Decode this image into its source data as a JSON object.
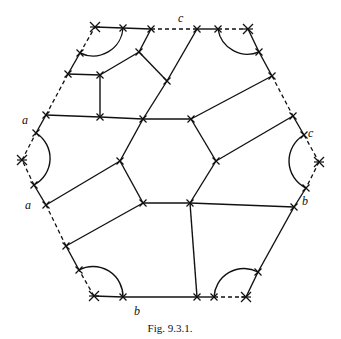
{
  "figure": {
    "caption": "Fig. 9.3.1.",
    "labels": [
      {
        "id": "c-top",
        "text": "c",
        "x": 178,
        "y": 22
      },
      {
        "id": "a-upper",
        "text": "a",
        "x": 22,
        "y": 124
      },
      {
        "id": "a-lower",
        "text": "a",
        "x": 25,
        "y": 209
      },
      {
        "id": "c-right",
        "text": "c",
        "x": 308,
        "y": 137
      },
      {
        "id": "b-right",
        "text": "b",
        "x": 302,
        "y": 205
      },
      {
        "id": "b-bottom",
        "text": "b",
        "x": 134,
        "y": 315
      }
    ],
    "vertices": {
      "TL": [
        95,
        27
      ],
      "T1": [
        123,
        28
      ],
      "T2": [
        151,
        29
      ],
      "T3": [
        197,
        29
      ],
      "T4": [
        218,
        29
      ],
      "TR": [
        248,
        29
      ],
      "UR1": [
        259,
        52
      ],
      "UR2": [
        272,
        76
      ],
      "UR3": [
        293,
        116
      ],
      "UR4": [
        304,
        135
      ],
      "R": [
        319,
        162
      ],
      "LR1": [
        306,
        188
      ],
      "LR2": [
        294,
        207
      ],
      "LR3": [
        258,
        272
      ],
      "BR": [
        246,
        297
      ],
      "B1": [
        214,
        297
      ],
      "B2": [
        197,
        297
      ],
      "B3": [
        123,
        297
      ],
      "BL": [
        94,
        296
      ],
      "LL1": [
        79,
        270
      ],
      "LL2": [
        66,
        246
      ],
      "LL3": [
        46,
        205
      ],
      "LL4": [
        34,
        185
      ],
      "L": [
        22,
        160
      ],
      "UL1": [
        36,
        133
      ],
      "UL2": [
        46,
        115
      ],
      "UL3": [
        68,
        74
      ],
      "UL4": [
        80,
        53
      ],
      "I1": [
        100,
        75
      ],
      "I2": [
        139,
        52
      ],
      "I3": [
        167,
        81
      ],
      "I4": [
        100,
        117
      ],
      "H1": [
        143,
        119
      ],
      "H2": [
        191,
        119
      ],
      "H3": [
        216,
        161
      ],
      "H4": [
        190,
        203
      ],
      "H5": [
        143,
        203
      ],
      "H6": [
        120,
        161
      ]
    },
    "solid_edges": [
      [
        "TL",
        "T1"
      ],
      [
        "T1",
        "T2"
      ],
      [
        "T3",
        "T4"
      ],
      [
        "TR",
        "UR1"
      ],
      [
        "UR1",
        "UR2"
      ],
      [
        "UR3",
        "UR4"
      ],
      [
        "LR1",
        "LR2"
      ],
      [
        "LR2",
        "LR3"
      ],
      [
        "LR3",
        "BR"
      ],
      [
        "B1",
        "B2"
      ],
      [
        "B2",
        "B3"
      ],
      [
        "B3",
        "BL"
      ],
      [
        "LL1",
        "LL2"
      ],
      [
        "LL3",
        "LL4"
      ],
      [
        "UL1",
        "UL2"
      ],
      [
        "UL3",
        "UL4"
      ],
      [
        "UL3",
        "I1"
      ],
      [
        "I1",
        "I2"
      ],
      [
        "I2",
        "T2"
      ],
      [
        "I2",
        "I3"
      ],
      [
        "I3",
        "T3"
      ],
      [
        "I3",
        "H1"
      ],
      [
        "I1",
        "I4"
      ],
      [
        "UL2",
        "I4"
      ],
      [
        "I4",
        "H1"
      ],
      [
        "H1",
        "H2"
      ],
      [
        "H2",
        "H3"
      ],
      [
        "H3",
        "H4"
      ],
      [
        "H4",
        "H5"
      ],
      [
        "H5",
        "H6"
      ],
      [
        "H6",
        "H1"
      ],
      [
        "H2",
        "UR2"
      ],
      [
        "H3",
        "UR3"
      ],
      [
        "H4",
        "LR2"
      ],
      [
        "H4",
        "B2"
      ],
      [
        "H6",
        "LL3"
      ],
      [
        "H5",
        "LL2"
      ]
    ],
    "dashed_edges": [
      [
        "T2",
        "T3"
      ],
      [
        "T4",
        "TR"
      ],
      [
        "UR2",
        "UR3"
      ],
      [
        "UR4",
        "R"
      ],
      [
        "R",
        "LR1"
      ],
      [
        "BR",
        "B1"
      ],
      [
        "BL",
        "LL1"
      ],
      [
        "LL2",
        "LL3"
      ],
      [
        "LL4",
        "L"
      ],
      [
        "L",
        "UL1"
      ],
      [
        "UL2",
        "UL3"
      ],
      [
        "UL4",
        "TL"
      ]
    ],
    "arcs": [
      {
        "id": "arc-top-left",
        "from": "UL4",
        "to": "T1",
        "r": 30
      },
      {
        "id": "arc-top-right",
        "from": "T4",
        "to": "UR1",
        "r": 30
      },
      {
        "id": "arc-right",
        "from": "UR4",
        "to": "LR1",
        "r": 30
      },
      {
        "id": "arc-bottom-right",
        "from": "LR3",
        "to": "B1",
        "r": 30
      },
      {
        "id": "arc-bottom-left",
        "from": "B3",
        "to": "LL1",
        "r": 30
      },
      {
        "id": "arc-left",
        "from": "LL4",
        "to": "UL1",
        "r": 30
      }
    ]
  }
}
